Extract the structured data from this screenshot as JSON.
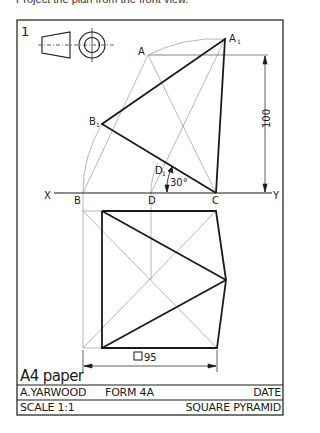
{
  "caption": "Project the plan from the front view.",
  "sheet": {
    "number": "1",
    "paper_label": "A4 paper"
  },
  "labels": {
    "A": "A",
    "A1": "A",
    "B": "B",
    "B1": "B",
    "C": "C",
    "D": "D",
    "D1": "D",
    "X": "X",
    "Y": "Y",
    "sub1": "1"
  },
  "dimensions": {
    "height": "100",
    "angle": "30°",
    "base": "95",
    "base_symbol": "square"
  },
  "title_block": {
    "author": "A.YARWOOD",
    "form": "FORM 4A",
    "date_label": "DATE",
    "scale": "SCALE 1:1",
    "title": "SQUARE PYRAMID"
  },
  "colors": {
    "ink": "#1a1a1a",
    "construction": "#9a9a9a",
    "paper": "#ffffff"
  }
}
